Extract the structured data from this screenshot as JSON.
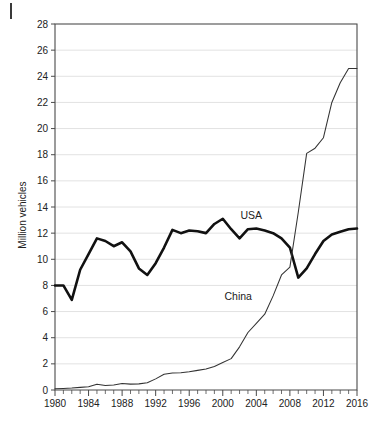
{
  "chart_data": {
    "type": "line",
    "title": "",
    "subtitle": "",
    "xlabel": "",
    "ylabel": "Million vehicles",
    "xlim": [
      1980,
      2016
    ],
    "ylim": [
      0,
      28
    ],
    "ytick_step": 2,
    "xtick_step": 4,
    "minor_xticks": "every 1 year",
    "grid": "horizontal gridlines only",
    "legend": "inline labels next to series",
    "yticks": [
      "0",
      "2",
      "4",
      "6",
      "8",
      "10",
      "12",
      "14",
      "16",
      "18",
      "20",
      "22",
      "24",
      "26",
      "28"
    ],
    "xticks": [
      "1980",
      "1984",
      "1988",
      "1992",
      "1996",
      "2000",
      "2004",
      "2008",
      "2012",
      "2016"
    ],
    "x": [
      1980,
      1981,
      1982,
      1983,
      1984,
      1985,
      1986,
      1987,
      1988,
      1989,
      1990,
      1991,
      1992,
      1993,
      1994,
      1995,
      1996,
      1997,
      1998,
      1999,
      2000,
      2001,
      2002,
      2003,
      2004,
      2005,
      2006,
      2007,
      2008,
      2009,
      2010,
      2011,
      2012,
      2013,
      2014,
      2015,
      2016
    ],
    "series": [
      {
        "name": "USA",
        "color": "#111111",
        "style": "thick-black-line",
        "label_x": 2002.1,
        "label_y": 13.05,
        "values": [
          8.0,
          8.0,
          6.9,
          9.2,
          10.4,
          11.6,
          11.4,
          11.0,
          11.3,
          10.6,
          9.3,
          8.8,
          9.7,
          10.9,
          12.25,
          12.0,
          12.2,
          12.15,
          12.0,
          12.7,
          13.1,
          12.3,
          11.6,
          12.3,
          12.35,
          12.2,
          12.0,
          11.6,
          10.9,
          8.6,
          9.3,
          10.4,
          11.4,
          11.9,
          12.1,
          12.3,
          12.35
        ]
      },
      {
        "name": "China",
        "color": "#333333",
        "style": "thin-black-line",
        "label_x": 2000.2,
        "label_y": 6.9,
        "values": [
          0.1,
          0.12,
          0.15,
          0.2,
          0.25,
          0.44,
          0.35,
          0.38,
          0.5,
          0.45,
          0.47,
          0.55,
          0.85,
          1.2,
          1.3,
          1.32,
          1.4,
          1.5,
          1.6,
          1.8,
          2.1,
          2.4,
          3.3,
          4.4,
          5.1,
          5.8,
          7.2,
          8.8,
          9.4,
          13.6,
          18.1,
          18.5,
          19.3,
          22.0,
          23.5,
          24.6,
          24.6
        ]
      }
    ]
  },
  "annotations": {
    "crop_mark": "page-crop-mark"
  }
}
